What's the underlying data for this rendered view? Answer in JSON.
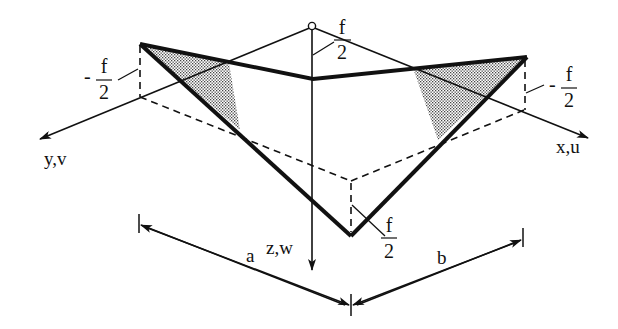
{
  "diagram": {
    "type": "structural-mechanics-figure",
    "axes": {
      "x": "x,u",
      "y": "y,v",
      "z": "z,w"
    },
    "dimensions": {
      "a": "a",
      "b": "b"
    },
    "annotations": {
      "left_corner": {
        "sign": "-",
        "num": "f",
        "den": "2"
      },
      "right_corner": {
        "sign": "-",
        "num": "f",
        "den": "2"
      },
      "top_origin": {
        "sign": "",
        "num": "f",
        "den": "2"
      },
      "bottom_corner": {
        "sign": "",
        "num": "f",
        "den": "2"
      }
    },
    "colors": {
      "ink": "#111111",
      "background": "#ffffff",
      "hatch": "#888888"
    }
  }
}
